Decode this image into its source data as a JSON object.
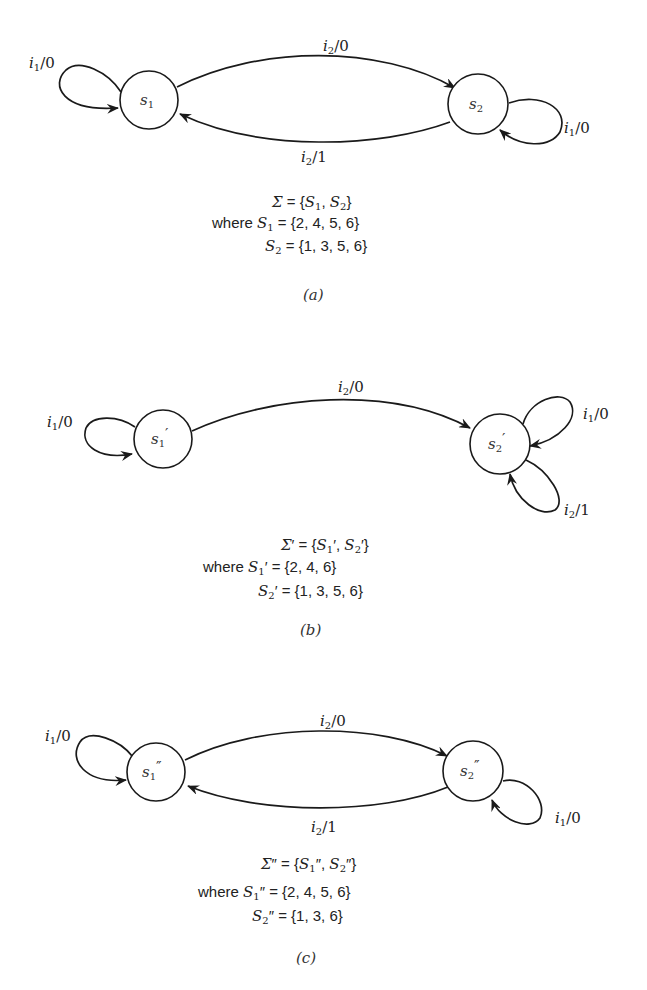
{
  "figures": [
    {
      "id": "a",
      "caption": "(a)",
      "states": [
        {
          "name": "s",
          "sub": "1",
          "prime": ""
        },
        {
          "name": "s",
          "sub": "2",
          "prime": ""
        }
      ],
      "transitions": [
        {
          "from": "s1",
          "to": "s1",
          "input": "i",
          "input_sub": "1",
          "output": "/0"
        },
        {
          "from": "s1",
          "to": "s2",
          "input": "i",
          "input_sub": "2",
          "output": "/0"
        },
        {
          "from": "s2",
          "to": "s1",
          "input": "i",
          "input_sub": "2",
          "output": "/1"
        },
        {
          "from": "s2",
          "to": "s2",
          "input": "i",
          "input_sub": "1",
          "output": "/0"
        }
      ],
      "equations": {
        "sigma": "Σ",
        "sigma_prime": "",
        "sigma_rhs_open": " = {",
        "set1": "S",
        "set1_sub": "1",
        "set1_prime": "",
        "sep": ", ",
        "set2": "S",
        "set2_sub": "2",
        "set2_prime": "",
        "close": "}",
        "where": "where ",
        "S1_values": " = {2, 4, 5, 6}",
        "S2_values": " = {1, 3, 5, 6}"
      }
    },
    {
      "id": "b",
      "caption": "(b)",
      "states": [
        {
          "name": "s",
          "sub": "1",
          "prime": "′"
        },
        {
          "name": "s",
          "sub": "2",
          "prime": "′"
        }
      ],
      "transitions": [
        {
          "from": "s1'",
          "to": "s1'",
          "input": "i",
          "input_sub": "1",
          "output": "/0"
        },
        {
          "from": "s1'",
          "to": "s2'",
          "input": "i",
          "input_sub": "2",
          "output": "/0"
        },
        {
          "from": "s2'",
          "to": "s2'",
          "input": "i",
          "input_sub": "1",
          "output": "/0"
        },
        {
          "from": "s2'",
          "to": "s2'",
          "input": "i",
          "input_sub": "2",
          "output": "/1"
        }
      ],
      "equations": {
        "sigma": "Σ",
        "sigma_prime": "′",
        "sigma_rhs_open": " = {",
        "set1": "S",
        "set1_sub": "1",
        "set1_prime": "′",
        "sep": ", ",
        "set2": "S",
        "set2_sub": "2",
        "set2_prime": "′",
        "close": "}",
        "where": "where ",
        "S1_values": " = {2, 4, 6}",
        "S2_values": " = {1, 3, 5, 6}"
      }
    },
    {
      "id": "c",
      "caption": "(c)",
      "states": [
        {
          "name": "s",
          "sub": "1",
          "prime": "″"
        },
        {
          "name": "s",
          "sub": "2",
          "prime": "″"
        }
      ],
      "transitions": [
        {
          "from": "s1''",
          "to": "s1''",
          "input": "i",
          "input_sub": "1",
          "output": "/0"
        },
        {
          "from": "s1''",
          "to": "s2''",
          "input": "i",
          "input_sub": "2",
          "output": "/0"
        },
        {
          "from": "s2''",
          "to": "s1''",
          "input": "i",
          "input_sub": "2",
          "output": "/1"
        },
        {
          "from": "s2''",
          "to": "s2''",
          "input": "i",
          "input_sub": "1",
          "output": "/0"
        }
      ],
      "equations": {
        "sigma": "Σ",
        "sigma_prime": "″",
        "sigma_rhs_open": " = {",
        "set1": "S",
        "set1_sub": "1",
        "set1_prime": "″",
        "sep": ", ",
        "set2": "S",
        "set2_sub": "2",
        "set2_prime": "″",
        "close": "}",
        "where": "where ",
        "S1_values": " = {2, 4, 5, 6}",
        "S2_values": " = {1, 3, 6}"
      }
    }
  ],
  "colors": {
    "background": "#ffffff",
    "stroke": "#1a1a1a",
    "text": "#222222"
  }
}
